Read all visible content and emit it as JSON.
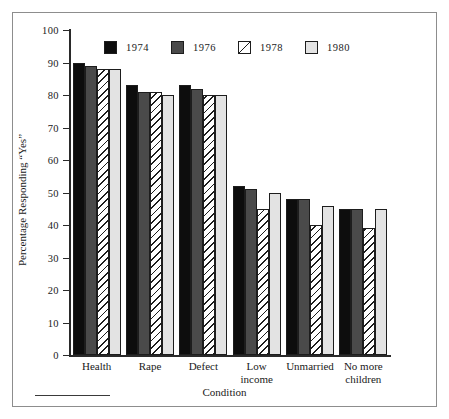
{
  "chart_data": {
    "type": "bar",
    "title": "",
    "xlabel": "Condition",
    "ylabel": "Percentage Responding “Yes”",
    "ylim": [
      0,
      100
    ],
    "ytick_step": 10,
    "grid": false,
    "legend_position": "top-center",
    "categories": [
      "Health",
      "Rape",
      "Defect",
      "Low income",
      "Unmarried",
      "No more children"
    ],
    "category_lines": [
      [
        "Health"
      ],
      [
        "Rape"
      ],
      [
        "Defect"
      ],
      [
        "Low",
        "income"
      ],
      [
        "Unmarried"
      ],
      [
        "No more",
        "children"
      ]
    ],
    "ytick_labels": [
      "0",
      "10",
      "20",
      "30",
      "40",
      "50",
      "60",
      "70",
      "80",
      "90",
      "100"
    ],
    "ytick_values": [
      0,
      10,
      20,
      30,
      40,
      50,
      60,
      70,
      80,
      90,
      100
    ],
    "series": [
      {
        "name": "1974",
        "fill": "solid-black",
        "color": "#0d0d0d",
        "values": [
          90,
          83,
          83,
          52,
          48,
          45
        ]
      },
      {
        "name": "1976",
        "fill": "solid-darkgray",
        "color": "#4a4a4a",
        "values": [
          89,
          81,
          82,
          51,
          48,
          45
        ]
      },
      {
        "name": "1978",
        "fill": "diagonal-hatch",
        "color": "#ffffff",
        "values": [
          88,
          81,
          80,
          45,
          40,
          39
        ]
      },
      {
        "name": "1980",
        "fill": "solid-lightgray",
        "color": "#e3e3e3",
        "values": [
          88,
          80,
          80,
          50,
          46,
          45
        ]
      }
    ]
  },
  "legend": {
    "entries": [
      {
        "label": "1974",
        "swatch": "legend-swatch-1974"
      },
      {
        "label": "1976",
        "swatch": "legend-swatch-1976"
      },
      {
        "label": "1978",
        "swatch": "legend-swatch-1978"
      },
      {
        "label": "1980",
        "swatch": "legend-swatch-1980"
      }
    ]
  }
}
